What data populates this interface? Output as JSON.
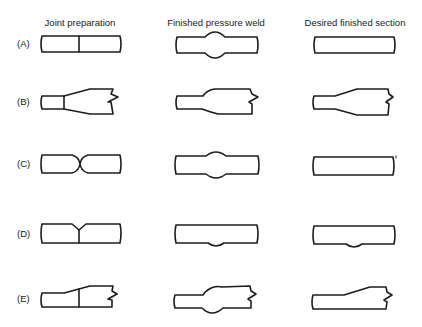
{
  "columns": [
    {
      "label": "Joint preparation",
      "x": 80
    },
    {
      "label": "Finished pressure weld",
      "x": 216
    },
    {
      "label": "Desired finished section",
      "x": 355
    }
  ],
  "rows": [
    {
      "label": "(A)",
      "y": 38
    },
    {
      "label": "(B)",
      "y": 96
    },
    {
      "label": "(C)",
      "y": 158
    },
    {
      "label": "(D)",
      "y": 228
    },
    {
      "label": "(E)",
      "y": 293
    }
  ],
  "colors": {
    "line": "#1c1c1c",
    "background": "#ffffff",
    "text": "#1a1a1a"
  }
}
